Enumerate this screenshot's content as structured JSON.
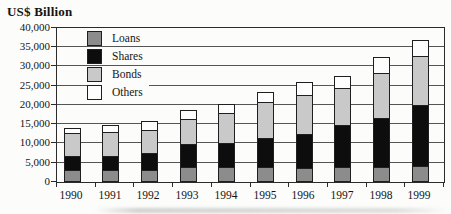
{
  "title": "US$ Billion",
  "chart_data": {
    "type": "bar",
    "stacked": true,
    "title": "US$ Billion",
    "xlabel": "",
    "ylabel": "US$ Billion",
    "categories": [
      "1990",
      "1991",
      "1992",
      "1993",
      "1994",
      "1995",
      "1996",
      "1997",
      "1998",
      "1999"
    ],
    "series": [
      {
        "name": "Loans",
        "color": "#8c8c8c",
        "values": [
          3000,
          3000,
          3200,
          3900,
          3900,
          3900,
          3600,
          3800,
          3800,
          4200
        ]
      },
      {
        "name": "Shares",
        "color": "#0d0d0d",
        "values": [
          3800,
          3800,
          4400,
          6000,
          6300,
          7600,
          8900,
          11100,
          12700,
          15800
        ]
      },
      {
        "name": "Bonds",
        "color": "#c9c9c9",
        "values": [
          5800,
          6200,
          5900,
          6400,
          7700,
          9400,
          10000,
          9600,
          11900,
          12800
        ]
      },
      {
        "name": "Others",
        "color": "#fdfdfd",
        "values": [
          1500,
          1900,
          2400,
          2300,
          2300,
          2600,
          3400,
          3100,
          4100,
          4100
        ]
      }
    ],
    "totals": [
      14100,
      14900,
      15900,
      18600,
      20200,
      23500,
      25900,
      27600,
      32500,
      36900
    ],
    "ylim": [
      0,
      40000
    ],
    "ytick_interval": 5000,
    "yticks": [
      {
        "value": 0,
        "label": "0"
      },
      {
        "value": 5000,
        "label": "5,000"
      },
      {
        "value": 10000,
        "label": "10,000"
      },
      {
        "value": 15000,
        "label": "15,000"
      },
      {
        "value": 20000,
        "label": "20,000"
      },
      {
        "value": 25000,
        "label": "25,000"
      },
      {
        "value": 30000,
        "label": "30,000"
      },
      {
        "value": 35000,
        "label": "35,000"
      },
      {
        "value": 40000,
        "label": "40,000"
      }
    ],
    "grid": true,
    "legend_position": "upper-left-inside"
  }
}
